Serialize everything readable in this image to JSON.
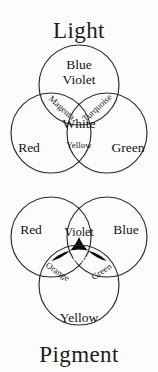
{
  "figure": {
    "name": "color-mixing-venn-diagrams",
    "background_color": "#fcfcfc",
    "stroke_color": "#2a2a2a",
    "text_color": "#1b1b1b"
  },
  "diagrams": [
    {
      "id": "light",
      "title": "Light",
      "title_position": "top",
      "model": "additive",
      "primaries": [
        "Blue Violet",
        "Red",
        "Green"
      ],
      "secondaries": [
        "Magenta",
        "Turquoise",
        "Yellow"
      ],
      "center": "White",
      "center_fill": "#ffffff",
      "labels": {
        "top_circle_line1": "Blue",
        "top_circle_line2": "Violet",
        "left_circle": "Red",
        "right_circle": "Green",
        "overlap_left": "Magenta",
        "overlap_right": "Turquoise",
        "overlap_bottom": "Yellow",
        "center": "White"
      }
    },
    {
      "id": "pigment",
      "title": "Pigment",
      "title_position": "bottom",
      "model": "subtractive",
      "primaries": [
        "Red",
        "Blue",
        "Yellow"
      ],
      "secondaries": [
        "Violet",
        "Orange",
        "Green"
      ],
      "center": "Black",
      "center_fill": "#090909",
      "labels": {
        "left_circle": "Red",
        "right_circle": "Blue",
        "bottom_circle": "Yellow",
        "overlap_top": "Violet",
        "overlap_left": "Orange",
        "overlap_right": "Green",
        "center": "Black"
      }
    }
  ]
}
